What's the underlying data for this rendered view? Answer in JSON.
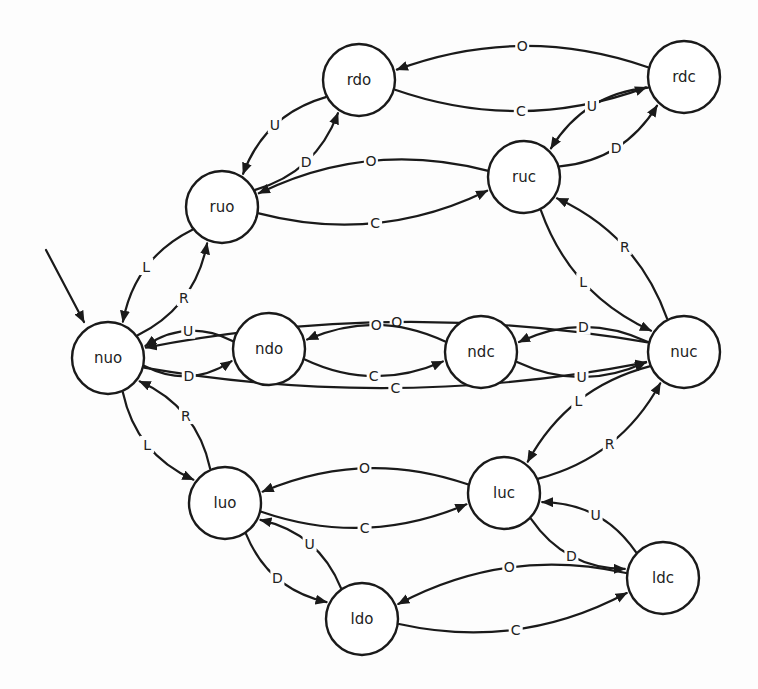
{
  "diagram": {
    "type": "state-machine",
    "start_state": "nuo",
    "colors": {
      "stroke": "#1a1a1a",
      "background": "#fdfdfd"
    },
    "nodes": [
      {
        "id": "rdo",
        "label": "rdo",
        "x": 359,
        "y": 80
      },
      {
        "id": "rdc",
        "label": "rdc",
        "x": 684,
        "y": 77
      },
      {
        "id": "ruo",
        "label": "ruo",
        "x": 222,
        "y": 207
      },
      {
        "id": "ruc",
        "label": "ruc",
        "x": 524,
        "y": 177
      },
      {
        "id": "nuo",
        "label": "nuo",
        "x": 108,
        "y": 358
      },
      {
        "id": "ndo",
        "label": "ndo",
        "x": 269,
        "y": 349
      },
      {
        "id": "ndc",
        "label": "ndc",
        "x": 481,
        "y": 352
      },
      {
        "id": "nuc",
        "label": "nuc",
        "x": 684,
        "y": 352
      },
      {
        "id": "luo",
        "label": "luo",
        "x": 225,
        "y": 503
      },
      {
        "id": "luc",
        "label": "luc",
        "x": 504,
        "y": 493
      },
      {
        "id": "ldc",
        "label": "ldc",
        "x": 663,
        "y": 578
      },
      {
        "id": "ldo",
        "label": "ldo",
        "x": 362,
        "y": 619
      }
    ],
    "edges": [
      {
        "from": "rdo",
        "to": "rdc",
        "label": "C"
      },
      {
        "from": "rdc",
        "to": "rdo",
        "label": "O"
      },
      {
        "from": "ruo",
        "to": "rdo",
        "label": "D"
      },
      {
        "from": "rdo",
        "to": "ruo",
        "label": "U"
      },
      {
        "from": "rdc",
        "to": "ruc",
        "label": "U"
      },
      {
        "from": "ruc",
        "to": "rdc",
        "label": "D"
      },
      {
        "from": "ruo",
        "to": "ruc",
        "label": "C"
      },
      {
        "from": "ruc",
        "to": "ruo",
        "label": "O"
      },
      {
        "from": "ruo",
        "to": "nuo",
        "label": "L"
      },
      {
        "from": "nuo",
        "to": "ruo",
        "label": "R"
      },
      {
        "from": "ruc",
        "to": "nuc",
        "label": "L"
      },
      {
        "from": "nuc",
        "to": "ruc",
        "label": "R"
      },
      {
        "from": "nuo",
        "to": "nuc",
        "label": "C"
      },
      {
        "from": "nuc",
        "to": "nuo",
        "label": "O"
      },
      {
        "from": "nuo",
        "to": "ndo",
        "label": "D"
      },
      {
        "from": "ndo",
        "to": "nuo",
        "label": "U"
      },
      {
        "from": "ndo",
        "to": "ndc",
        "label": "C"
      },
      {
        "from": "ndc",
        "to": "ndo",
        "label": "O"
      },
      {
        "from": "ndc",
        "to": "nuc",
        "label": "U"
      },
      {
        "from": "nuc",
        "to": "ndc",
        "label": "D"
      },
      {
        "from": "nuo",
        "to": "luo",
        "label": "L"
      },
      {
        "from": "luo",
        "to": "nuo",
        "label": "R"
      },
      {
        "from": "nuc",
        "to": "luc",
        "label": "L"
      },
      {
        "from": "luc",
        "to": "nuc",
        "label": "R"
      },
      {
        "from": "luo",
        "to": "luc",
        "label": "C"
      },
      {
        "from": "luc",
        "to": "luo",
        "label": "O"
      },
      {
        "from": "luo",
        "to": "ldo",
        "label": "D"
      },
      {
        "from": "ldo",
        "to": "luo",
        "label": "U"
      },
      {
        "from": "luc",
        "to": "ldc",
        "label": "D"
      },
      {
        "from": "ldc",
        "to": "luc",
        "label": "U"
      },
      {
        "from": "ldo",
        "to": "ldc",
        "label": "C"
      },
      {
        "from": "ldc",
        "to": "ldo",
        "label": "O"
      }
    ]
  }
}
